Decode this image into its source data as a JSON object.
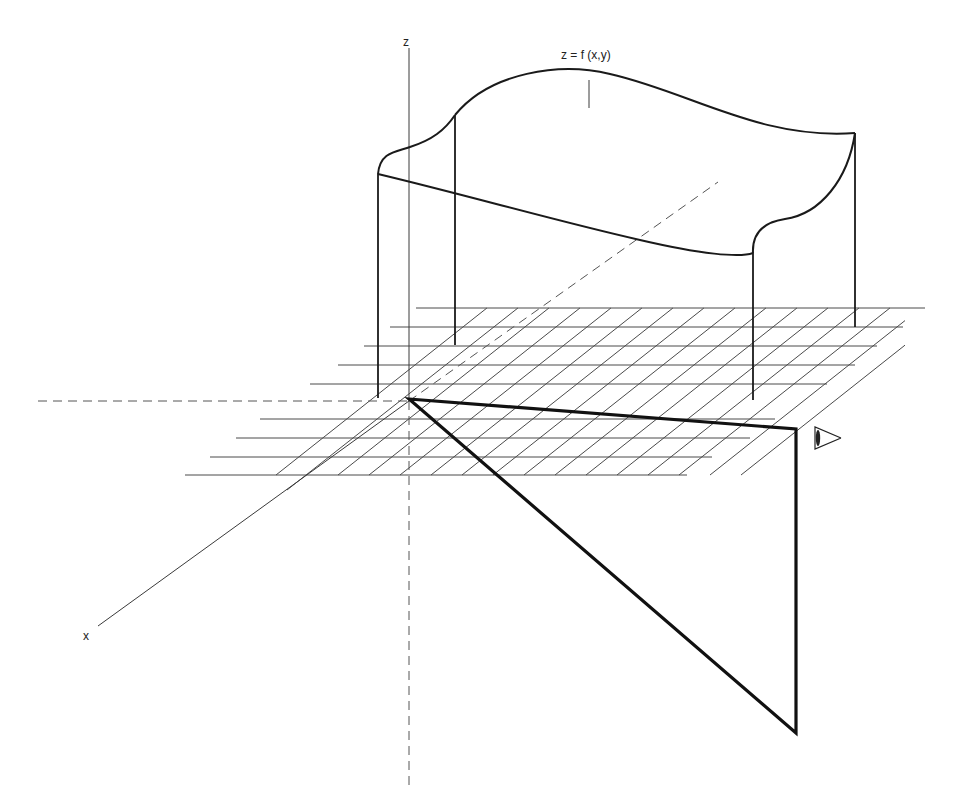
{
  "diagram": {
    "colors": {
      "ink": "#1a1a1a",
      "grid": "#4a4a4a",
      "background": "#ffffff"
    },
    "labels": {
      "z_axis": "z",
      "x_axis": "x",
      "surface": "z = f (x,y)"
    },
    "axes": {
      "origin": [
        409,
        401
      ],
      "z_axis": {
        "from": [
          409,
          48
        ],
        "to": [
          409,
          401
        ],
        "dashed_to": [
          409,
          785
        ]
      },
      "x_axis": {
        "from": [
          409,
          401
        ],
        "to": [
          98,
          626
        ]
      },
      "y_axis_dashed": {
        "from": [
          409,
          401
        ],
        "to": [
          718,
          182
        ]
      },
      "horizontal_dashed": {
        "from": [
          38,
          401
        ],
        "to": [
          409,
          401
        ]
      }
    },
    "grid": {
      "horizontal_lines": [
        {
          "y": 308,
          "x1": 416,
          "x2": 925
        },
        {
          "y": 327,
          "x1": 390,
          "x2": 903
        },
        {
          "y": 346,
          "x1": 364,
          "x2": 877
        },
        {
          "y": 365,
          "x1": 338,
          "x2": 855
        },
        {
          "y": 384,
          "x1": 310,
          "x2": 827
        },
        {
          "y": 419,
          "x1": 260,
          "x2": 775
        },
        {
          "y": 438,
          "x1": 236,
          "x2": 750
        },
        {
          "y": 457,
          "x1": 210,
          "x2": 712
        },
        {
          "y": 475,
          "x1": 185,
          "x2": 687
        }
      ],
      "diagonal_lines": {
        "count": 16,
        "bottom_y": 475,
        "top_y": 308,
        "first_bottom_x": 276,
        "spacing_x": 31,
        "run_per_rise": 1.263
      }
    },
    "surface": {
      "posts": [
        {
          "name": "front-left",
          "x": 378,
          "top": 174,
          "bottom": 398
        },
        {
          "name": "back-left",
          "x": 455,
          "top": 115,
          "bottom": 345
        },
        {
          "name": "front-right",
          "x": 753,
          "top": 253,
          "bottom": 400
        },
        {
          "name": "back-right",
          "x": 855,
          "top": 133,
          "bottom": 327
        }
      ],
      "leader": {
        "x": 589,
        "y1": 80,
        "y2": 108
      }
    },
    "viewing_triangle": {
      "apex": [
        409,
        399
      ],
      "top_right": [
        796,
        429
      ],
      "bottom": [
        796,
        733
      ]
    },
    "eye": {
      "apex": [
        815,
        437
      ],
      "label": "eye-icon"
    }
  }
}
